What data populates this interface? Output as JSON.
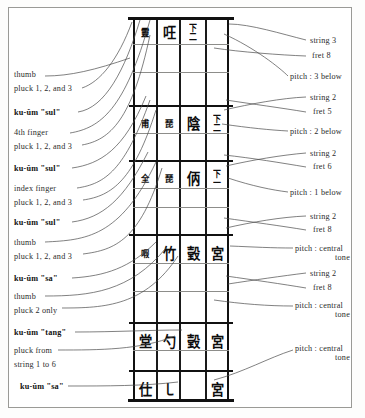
{
  "figure": {
    "ink_color": "#111111",
    "grid_line_color": "#8d8d8a",
    "paper_color": "#ffffff"
  },
  "left_labels": [
    {
      "id": "l1",
      "line1": "thumb",
      "line2": "pluck 1, 2, and 3",
      "bold": false,
      "x": 14,
      "y": 74
    },
    {
      "id": "l2",
      "line1": "ku-ŭm \"sul\"",
      "line2": "",
      "bold": true,
      "x": 14,
      "y": 112
    },
    {
      "id": "l3",
      "line1": "4th finger",
      "line2": "pluck 1, 2, and 3",
      "bold": false,
      "x": 14,
      "y": 131
    },
    {
      "id": "l4",
      "line1": "ku-ŭm \"sul\"",
      "line2": "",
      "bold": true,
      "x": 14,
      "y": 166
    },
    {
      "id": "l5",
      "line1": "index finger",
      "line2": "pluck 1, 2, and 3",
      "bold": false,
      "x": 14,
      "y": 186
    },
    {
      "id": "l6",
      "line1": "ku-ŭm \"sul\"",
      "line2": "",
      "bold": true,
      "x": 14,
      "y": 220
    },
    {
      "id": "l7",
      "line1": "thumb",
      "line2": "pluck 1, 2, and 3",
      "bold": false,
      "x": 14,
      "y": 240
    },
    {
      "id": "l8",
      "line1": "ku-ŭm \"sa\"",
      "line2": "",
      "bold": true,
      "x": 14,
      "y": 276
    },
    {
      "id": "l9",
      "line1": "thumb",
      "line2": "pluck 2 only",
      "bold": false,
      "x": 14,
      "y": 294
    },
    {
      "id": "l10",
      "line1": "ku-ŭm \"tang\"",
      "line2": "",
      "bold": true,
      "x": 14,
      "y": 330
    },
    {
      "id": "l11",
      "line1": "pluck from",
      "line2": "string 1 to 6",
      "bold": false,
      "x": 14,
      "y": 348
    },
    {
      "id": "l12",
      "line1": "ku-ŭm \"sa\"",
      "line2": "",
      "bold": true,
      "x": 20,
      "y": 384
    }
  ],
  "right_labels": [
    {
      "id": "r1",
      "line1": "string 3",
      "line2": "",
      "x": 308,
      "y": 40
    },
    {
      "id": "r2",
      "line1": "fret 8",
      "line2": "",
      "x": 308,
      "y": 55
    },
    {
      "id": "r3",
      "line1": "pitch : 3 below",
      "line2": "",
      "x": 290,
      "y": 76
    },
    {
      "id": "r4",
      "line1": "string 2",
      "line2": "",
      "x": 308,
      "y": 97
    },
    {
      "id": "r5",
      "line1": "fret 5",
      "line2": "",
      "x": 308,
      "y": 111
    },
    {
      "id": "r6",
      "line1": "pitch : 2 below",
      "line2": "",
      "x": 290,
      "y": 131
    },
    {
      "id": "r7",
      "line1": "string 2",
      "line2": "",
      "x": 308,
      "y": 153
    },
    {
      "id": "r8",
      "line1": "fret 6",
      "line2": "",
      "x": 308,
      "y": 166
    },
    {
      "id": "r9",
      "line1": "pitch : 1 below",
      "line2": "",
      "x": 290,
      "y": 192
    },
    {
      "id": "r10",
      "line1": "string 2",
      "line2": "",
      "x": 308,
      "y": 216
    },
    {
      "id": "r11",
      "line1": "fret 8",
      "line2": "",
      "x": 308,
      "y": 229
    },
    {
      "id": "r12",
      "line1": "pitch : central",
      "line2": "tone",
      "x": 295,
      "y": 248
    },
    {
      "id": "r13",
      "line1": "string 2",
      "line2": "",
      "x": 308,
      "y": 273
    },
    {
      "id": "r14",
      "line1": "fret 8",
      "line2": "",
      "x": 308,
      "y": 287
    },
    {
      "id": "r15",
      "line1": "pitch : central",
      "line2": "tone",
      "x": 295,
      "y": 305
    },
    {
      "id": "r16",
      "line1": "pitch : central",
      "line2": "tone",
      "x": 295,
      "y": 348
    }
  ],
  "tablature": {
    "columns": 4,
    "column_order": "right-to-left (classical vertical reading)",
    "rows": [
      {
        "id": "row1",
        "y": 20,
        "cells": [
          {
            "text": "靈",
            "size": "small"
          },
          {
            "text": "㕵",
            "size": "normal"
          },
          {
            "text": "下二",
            "size": "stack",
            "stack": [
              "下",
              "二"
            ]
          },
          {
            "text": "",
            "size": "blank"
          }
        ]
      },
      {
        "id": "row2",
        "y": 111,
        "cells": [
          {
            "text": "甫",
            "size": "small"
          },
          {
            "text": "琵",
            "size": "small"
          },
          {
            "text": "陰",
            "size": "normal"
          },
          {
            "text": "下二",
            "size": "stack",
            "stack": [
              "下",
              "二"
            ]
          }
        ]
      },
      {
        "id": "row3",
        "y": 166,
        "cells": [
          {
            "text": "全",
            "size": "small"
          },
          {
            "text": "琵",
            "size": "small"
          },
          {
            "text": "㑂",
            "size": "normal"
          },
          {
            "text": "下一",
            "size": "stack",
            "stack": [
              "下",
              "一"
            ]
          }
        ]
      },
      {
        "id": "row4",
        "y": 244,
        "cells": [
          {
            "text": "㗇",
            "size": "small"
          },
          {
            "text": "上",
            "size": "normal"
          },
          {
            "text": "竹",
            "size": "normal"
          },
          {
            "text": "㲄",
            "size": "normal"
          },
          {
            "text": "宮",
            "size": "normal"
          }
        ]
      },
      {
        "id": "row5",
        "y": 333,
        "cells": [
          {
            "text": "堂",
            "size": "normal"
          },
          {
            "text": "勺",
            "size": "normal"
          },
          {
            "text": "㲄",
            "size": "normal"
          },
          {
            "text": "宮",
            "size": "normal"
          }
        ]
      },
      {
        "id": "row6",
        "y": 382,
        "cells": [
          {
            "text": "仕",
            "size": "normal"
          },
          {
            "text": "㇄",
            "size": "normal"
          },
          {
            "text": "",
            "size": "blank"
          },
          {
            "text": "宮",
            "size": "normal"
          }
        ]
      }
    ],
    "major_dividers_y": [
      17,
      105,
      160,
      234,
      322,
      370,
      401
    ],
    "minor_dividers_y": [
      44,
      72,
      133,
      188,
      207,
      263,
      291,
      350
    ]
  }
}
